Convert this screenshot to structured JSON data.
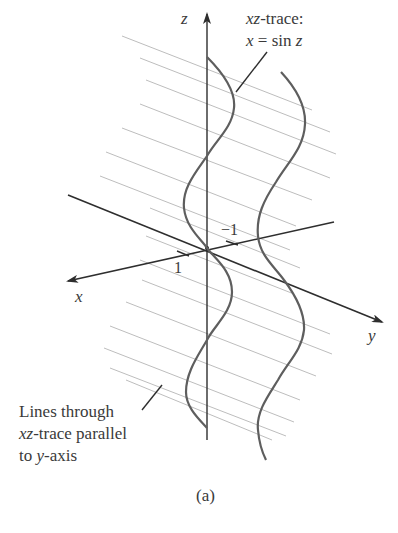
{
  "figure": {
    "caption": "(a)",
    "axes": {
      "z_label": "z",
      "x_label": "x",
      "y_label": "y",
      "tick_x": "1",
      "tick_y": "−1"
    },
    "annotations": {
      "trace_title_var": "xz",
      "trace_title_rest": "-trace:",
      "trace_eq_lhs": "x",
      "trace_eq_mid": " = sin ",
      "trace_eq_rhs": "z",
      "lines_line1": "Lines through",
      "lines_line2_var": "xz",
      "lines_line2_rest": "-trace parallel",
      "lines_line3_pre": "to ",
      "lines_line3_var": "y",
      "lines_line3_rest": "-axis"
    },
    "colors": {
      "axis": "#2e2e2e",
      "curve": "#5a5a5a",
      "rulings": "#b8b8b8",
      "text": "#3a3a3a"
    }
  }
}
